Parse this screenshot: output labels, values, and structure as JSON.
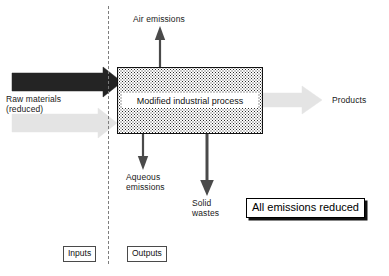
{
  "diagram": {
    "divider": {
      "name": "inputs-outputs-divider",
      "style": "dashed"
    },
    "process_box": {
      "label": "Modified industrial process",
      "fill": "stippled",
      "border_color": "#111111"
    },
    "inputs": {
      "primary_arrow": {
        "label": "Raw materials\n(reduced)",
        "color": "#242424",
        "direction": "right"
      },
      "secondary_arrow": {
        "label": "",
        "color": "#e2e2e2",
        "direction": "right"
      }
    },
    "outputs": {
      "air": {
        "label": "Air emissions",
        "color": "#4a4a4a",
        "direction": "up"
      },
      "aqueous": {
        "label": "Aqueous\nemissions",
        "color": "#4a4a4a",
        "direction": "down"
      },
      "solid": {
        "label": "Solid\nwastes",
        "color": "#4a4a4a",
        "direction": "down"
      },
      "products": {
        "label": "Products",
        "color": "#e2e2e2",
        "direction": "right"
      }
    },
    "callout": {
      "label": "All emissions reduced"
    },
    "legend": {
      "inputs_label": "Inputs",
      "outputs_label": "Outputs"
    }
  }
}
